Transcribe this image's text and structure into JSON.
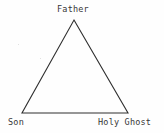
{
  "figure": {
    "background_color": "#fefefe",
    "line_color": "#2e2e2e",
    "text_color": "#373737"
  },
  "labels": {
    "apex": "Father",
    "bottom_left": "Son",
    "bottom_right": "Holy Ghost"
  },
  "geometry": {
    "apex": {
      "x": 74,
      "y": 20
    },
    "bottom_left": {
      "x": 22,
      "y": 113
    },
    "bottom_right": {
      "x": 128,
      "y": 113
    },
    "stroke_width": 1.1
  }
}
